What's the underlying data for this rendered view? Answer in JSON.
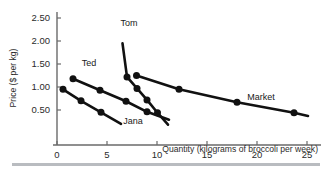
{
  "figure": {
    "background_color": "#ffffff",
    "ink_color": "#111111",
    "axis_color": "#6b6b6b",
    "divider_color": "#b9bcc0"
  },
  "chart_data": {
    "type": "line",
    "title": "",
    "subtitle": "",
    "xlabel": "Quantity (kilograms of broccoli per week)",
    "ylabel": "Price ($ per kg)",
    "xlim": [
      0,
      25.8
    ],
    "ylim": [
      0,
      2.75
    ],
    "xticks": [
      0,
      5,
      10,
      15,
      20,
      25
    ],
    "xtick_labels": [
      "0",
      "5",
      "10",
      "15",
      "20",
      "25"
    ],
    "yticks": [
      0.5,
      1.0,
      1.5,
      2.0,
      2.5
    ],
    "ytick_labels": [
      "0.50",
      "1.00",
      "1.50",
      "2.00",
      "2.50"
    ],
    "grid": false,
    "legend_position": "inline-labels",
    "annotations": [
      "Tom",
      "Ted",
      "Jana",
      "Market"
    ],
    "series": [
      {
        "name": "Tom",
        "label": "Tom",
        "label_x": 7.2,
        "label_y": 2.33,
        "marker": "filled-circle",
        "x": [
          6.55,
          7.0,
          8.0,
          9.0,
          10.05,
          11.1
        ],
        "y": [
          1.95,
          1.22,
          0.97,
          0.72,
          0.44,
          0.18
        ],
        "points": [
          {
            "x": 7.0,
            "y": 1.22
          },
          {
            "x": 8.0,
            "y": 0.97
          },
          {
            "x": 9.0,
            "y": 0.72
          },
          {
            "x": 10.05,
            "y": 0.44
          }
        ]
      },
      {
        "name": "Ted",
        "label": "Ted",
        "label_x": 3.2,
        "label_y": 1.45,
        "marker": "filled-circle",
        "x": [
          1.6,
          4.3,
          6.9,
          9.0,
          11.2
        ],
        "y": [
          1.18,
          0.93,
          0.69,
          0.46,
          0.29
        ],
        "points": [
          {
            "x": 1.6,
            "y": 1.18
          },
          {
            "x": 4.3,
            "y": 0.93
          },
          {
            "x": 6.9,
            "y": 0.69
          },
          {
            "x": 9.0,
            "y": 0.46
          }
        ]
      },
      {
        "name": "Jana",
        "label": "Jana",
        "label_x": 7.6,
        "label_y": 0.19,
        "marker": "filled-circle",
        "x": [
          0.6,
          2.4,
          4.4,
          6.4
        ],
        "y": [
          0.95,
          0.7,
          0.45,
          0.2
        ],
        "points": [
          {
            "x": 0.6,
            "y": 0.95
          },
          {
            "x": 2.4,
            "y": 0.7
          },
          {
            "x": 4.4,
            "y": 0.45
          }
        ]
      },
      {
        "name": "Market",
        "label": "Market",
        "label_x": 20.4,
        "label_y": 0.72,
        "marker": "filled-circle",
        "x": [
          7.95,
          12.2,
          18.0,
          23.7,
          25.1
        ],
        "y": [
          1.25,
          0.95,
          0.67,
          0.44,
          0.37
        ],
        "points": [
          {
            "x": 7.95,
            "y": 1.25
          },
          {
            "x": 12.2,
            "y": 0.95
          },
          {
            "x": 18.0,
            "y": 0.67
          },
          {
            "x": 23.7,
            "y": 0.44
          }
        ]
      }
    ]
  }
}
